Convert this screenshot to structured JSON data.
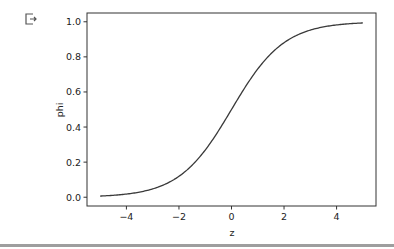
{
  "cell": {
    "output_icon": "output-redirect-icon"
  },
  "chart_data": {
    "type": "line",
    "title": "",
    "xlabel": "z",
    "ylabel": "phi",
    "xlim": [
      -5.5,
      5.5
    ],
    "ylim": [
      -0.05,
      1.05
    ],
    "xticks": [
      -4,
      -2,
      0,
      2,
      4
    ],
    "xtick_labels": [
      "−4",
      "−2",
      "0",
      "2",
      "4"
    ],
    "yticks": [
      0.0,
      0.2,
      0.4,
      0.6,
      0.8,
      1.0
    ],
    "ytick_labels": [
      "0.0",
      "0.2",
      "0.4",
      "0.6",
      "0.8",
      "1.0"
    ],
    "grid": false,
    "series": [
      {
        "name": "sigmoid",
        "function": "1/(1+exp(-z))",
        "x": [
          -5,
          -4,
          -3,
          -2,
          -1,
          0,
          1,
          2,
          3,
          4,
          5
        ],
        "values": [
          0.0067,
          0.018,
          0.047,
          0.119,
          0.269,
          0.5,
          0.731,
          0.881,
          0.953,
          0.982,
          0.9933
        ],
        "color": "#3a3a3a"
      }
    ]
  }
}
